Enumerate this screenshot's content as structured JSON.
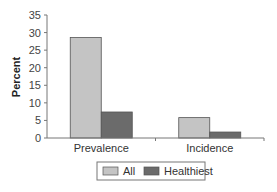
{
  "chart_data": {
    "type": "bar",
    "title": "",
    "xlabel": "",
    "ylabel": "Percent",
    "ylim": [
      0,
      35
    ],
    "yticks": [
      0,
      5,
      10,
      15,
      20,
      25,
      30,
      35
    ],
    "categories": [
      "Prevalence",
      "Incidence"
    ],
    "series": [
      {
        "name": "All",
        "values": [
          28.6,
          5.8
        ],
        "color": "#c4c4c4"
      },
      {
        "name": "Healthiest",
        "values": [
          7.4,
          1.7
        ],
        "color": "#6b6b6b"
      }
    ],
    "grid": false,
    "legend_position": "bottom"
  }
}
